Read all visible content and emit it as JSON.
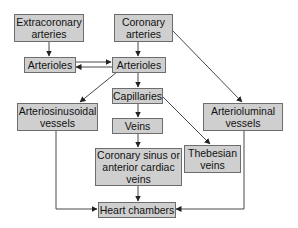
{
  "diagram": {
    "nodes": {
      "extracoronary_arteries": {
        "label": "Extracoronary\narteries"
      },
      "coronary_arteries": {
        "label": "Coronary\narteries"
      },
      "arterioles_left": {
        "label": "Arterioles"
      },
      "arterioles_center": {
        "label": "Arterioles"
      },
      "arteriosinusoidal_vessels": {
        "label": "Arteriosinusoidal\nvessels"
      },
      "capillaries": {
        "label": "Capillaries"
      },
      "veins": {
        "label": "Veins"
      },
      "arterioluminal_vessels": {
        "label": "Arterioluminal\nvessels"
      },
      "thebesian_veins": {
        "label": "Thebesian\nveins"
      },
      "coronary_sinus": {
        "label": "Coronary sinus or\nanterior cardiac\nveins"
      },
      "heart_chambers": {
        "label": "Heart chambers"
      }
    },
    "edges": [
      {
        "from": "Extracoronary arteries",
        "to": "Arterioles (left)"
      },
      {
        "from": "Coronary arteries",
        "to": "Arterioles (center)"
      },
      {
        "from": "Coronary arteries",
        "to": "Arterioluminal vessels"
      },
      {
        "from": "Arterioles (left)",
        "to": "Arterioles (center)"
      },
      {
        "from": "Arterioles (center)",
        "to": "Arterioles (left)"
      },
      {
        "from": "Arterioles (center)",
        "to": "Arteriosinusoidal vessels"
      },
      {
        "from": "Arterioles (center)",
        "to": "Capillaries"
      },
      {
        "from": "Capillaries",
        "to": "Veins"
      },
      {
        "from": "Capillaries",
        "to": "Thebesian veins"
      },
      {
        "from": "Veins",
        "to": "Coronary sinus or anterior cardiac veins"
      },
      {
        "from": "Coronary sinus or anterior cardiac veins",
        "to": "Heart chambers"
      },
      {
        "from": "Arteriosinusoidal vessels",
        "to": "Heart chambers"
      },
      {
        "from": "Arterioluminal vessels",
        "to": "Heart chambers"
      }
    ],
    "colors": {
      "box_fill": "#cfcfcf",
      "box_border": "#6d6d6d",
      "line": "#333333"
    }
  }
}
